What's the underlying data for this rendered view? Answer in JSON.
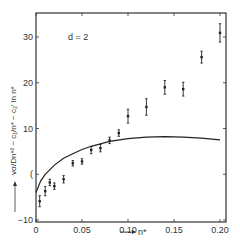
{
  "chart_data": {
    "type": "scatter",
    "title": "",
    "annotation": "d = 2",
    "xlabel": "n*",
    "ylabel": "vσ/Dn*² − c₁/n* − c₂′ ln n*",
    "xlim": [
      0,
      0.2
    ],
    "ylim": [
      -10,
      35
    ],
    "xticks": [
      0,
      0.05,
      0.1,
      0.15,
      0.2
    ],
    "xtick_labels": [
      "0",
      "0.05",
      "0.10",
      "0.15",
      "0.20"
    ],
    "yticks": [
      -10,
      0,
      10,
      20,
      30
    ],
    "ytick_labels": [
      "−10",
      "(",
      "10",
      "20",
      "30"
    ],
    "grid": false,
    "series": [
      {
        "name": "measured",
        "kind": "points-with-error-bars",
        "x": [
          0.004,
          0.01,
          0.015,
          0.02,
          0.03,
          0.04,
          0.05,
          0.06,
          0.07,
          0.08,
          0.09,
          0.1,
          0.12,
          0.14,
          0.16,
          0.18,
          0.2
        ],
        "y": [
          -5.9,
          -3.7,
          -1.8,
          -2.6,
          -1.1,
          2.4,
          2.8,
          5.3,
          5.7,
          7.4,
          9.0,
          12.7,
          14.7,
          19.0,
          18.6,
          25.6,
          30.9
        ],
        "yerr": [
          1.2,
          1.0,
          0.7,
          0.7,
          0.8,
          0.6,
          0.6,
          0.8,
          0.8,
          0.7,
          0.7,
          1.5,
          1.8,
          1.5,
          1.5,
          1.3,
          2.0
        ]
      },
      {
        "name": "theory",
        "kind": "line",
        "x": [
          0.0,
          0.005,
          0.01,
          0.02,
          0.03,
          0.04,
          0.05,
          0.06,
          0.08,
          0.1,
          0.12,
          0.14,
          0.16,
          0.18,
          0.2
        ],
        "y": [
          -4.0,
          -1.5,
          0.0,
          2.0,
          3.5,
          4.5,
          5.4,
          6.1,
          7.2,
          7.8,
          8.1,
          8.2,
          8.1,
          7.9,
          7.5
        ]
      }
    ]
  }
}
